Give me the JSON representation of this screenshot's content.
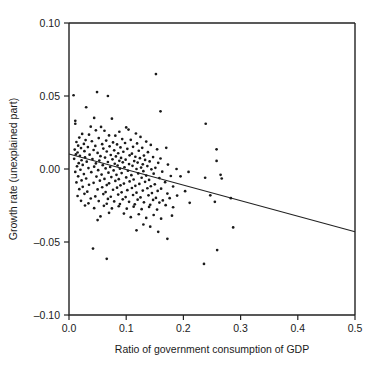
{
  "chart_data": {
    "type": "scatter",
    "title": "",
    "xlabel": "Ratio of government consumption of GDP",
    "ylabel": "Growth rate (unexplained part)",
    "xlim": [
      0.0,
      0.5
    ],
    "ylim": [
      -0.1,
      0.1
    ],
    "xticks": [
      "0.0",
      "0.1",
      "0.2",
      "0.3",
      "0.4",
      "0.5"
    ],
    "xtick_values": [
      0.0,
      0.1,
      0.2,
      0.3,
      0.4,
      0.5
    ],
    "yticks": [
      "0.10",
      "0.05",
      "0.00",
      "–0.05",
      "–0.10"
    ],
    "ytick_values": [
      0.1,
      0.05,
      0.0,
      -0.05,
      -0.1
    ],
    "grid": false,
    "legend": null,
    "marker": "dot",
    "marker_color": "#1a1a1a",
    "n_points": 262,
    "fit_line": {
      "type": "linear-regression",
      "intercept": 0.0103,
      "slope": -0.1066,
      "x_start": 0.0,
      "x_end": 0.5,
      "y_start": 0.0103,
      "y_end": -0.043,
      "color": "#222222"
    },
    "points": [
      [
        0.008,
        0.0505
      ],
      [
        0.049,
        0.0527
      ],
      [
        0.068,
        0.05
      ],
      [
        0.152,
        0.065
      ],
      [
        0.03,
        0.0423
      ],
      [
        0.16,
        0.0395
      ],
      [
        0.044,
        0.035
      ],
      [
        0.075,
        0.0345
      ],
      [
        0.239,
        0.031
      ],
      [
        0.011,
        0.033
      ],
      [
        0.011,
        0.031
      ],
      [
        0.038,
        0.029
      ],
      [
        0.056,
        0.0288
      ],
      [
        0.1,
        0.0285
      ],
      [
        0.104,
        0.027
      ],
      [
        0.047,
        0.0265
      ],
      [
        0.062,
        0.0262
      ],
      [
        0.088,
        0.0255
      ],
      [
        0.117,
        0.0243
      ],
      [
        0.023,
        0.024
      ],
      [
        0.035,
        0.0235
      ],
      [
        0.07,
        0.023
      ],
      [
        0.081,
        0.0228
      ],
      [
        0.125,
        0.022
      ],
      [
        0.018,
        0.0215
      ],
      [
        0.052,
        0.0212
      ],
      [
        0.093,
        0.0205
      ],
      [
        0.108,
        0.02
      ],
      [
        0.029,
        0.0198
      ],
      [
        0.065,
        0.0195
      ],
      [
        0.04,
        0.019
      ],
      [
        0.135,
        0.0188
      ],
      [
        0.013,
        0.0185
      ],
      [
        0.077,
        0.0182
      ],
      [
        0.098,
        0.0178
      ],
      [
        0.119,
        0.0175
      ],
      [
        0.026,
        0.0172
      ],
      [
        0.058,
        0.017
      ],
      [
        0.084,
        0.0168
      ],
      [
        0.143,
        0.0165
      ],
      [
        0.016,
        0.016
      ],
      [
        0.046,
        0.0158
      ],
      [
        0.071,
        0.0155
      ],
      [
        0.112,
        0.0152
      ],
      [
        0.033,
        0.015
      ],
      [
        0.09,
        0.0148
      ],
      [
        0.128,
        0.0145
      ],
      [
        0.021,
        0.0143
      ],
      [
        0.06,
        0.014
      ],
      [
        0.102,
        0.0138
      ],
      [
        0.154,
        0.0135
      ],
      [
        0.01,
        0.0133
      ],
      [
        0.043,
        0.013
      ],
      [
        0.079,
        0.0128
      ],
      [
        0.122,
        0.0125
      ],
      [
        0.027,
        0.0122
      ],
      [
        0.066,
        0.012
      ],
      [
        0.095,
        0.0118
      ],
      [
        0.138,
        0.0115
      ],
      [
        0.015,
        0.0113
      ],
      [
        0.05,
        0.011
      ],
      [
        0.086,
        0.0108
      ],
      [
        0.11,
        0.0105
      ],
      [
        0.17,
        0.0145
      ],
      [
        0.012,
        0.01
      ],
      [
        0.036,
        0.0098
      ],
      [
        0.073,
        0.0096
      ],
      [
        0.106,
        0.0094
      ],
      [
        0.131,
        0.0092
      ],
      [
        0.019,
        0.009
      ],
      [
        0.055,
        0.0088
      ],
      [
        0.082,
        0.0086
      ],
      [
        0.116,
        0.0084
      ],
      [
        0.147,
        0.0082
      ],
      [
        0.028,
        0.008
      ],
      [
        0.063,
        0.0078
      ],
      [
        0.091,
        0.0076
      ],
      [
        0.124,
        0.0074
      ],
      [
        0.16,
        0.0072
      ],
      [
        0.009,
        0.007
      ],
      [
        0.041,
        0.0068
      ],
      [
        0.076,
        0.0066
      ],
      [
        0.099,
        0.0064
      ],
      [
        0.133,
        0.0062
      ],
      [
        0.258,
        0.0135
      ],
      [
        0.022,
        0.006
      ],
      [
        0.053,
        0.0058
      ],
      [
        0.088,
        0.0056
      ],
      [
        0.114,
        0.0054
      ],
      [
        0.141,
        0.0052
      ],
      [
        0.031,
        0.005
      ],
      [
        0.068,
        0.0048
      ],
      [
        0.094,
        0.0046
      ],
      [
        0.12,
        0.0044
      ],
      [
        0.156,
        0.0042
      ],
      [
        0.017,
        0.004
      ],
      [
        0.047,
        0.0038
      ],
      [
        0.08,
        0.0036
      ],
      [
        0.105,
        0.0034
      ],
      [
        0.129,
        0.0032
      ],
      [
        0.173,
        0.003
      ],
      [
        0.024,
        0.0028
      ],
      [
        0.059,
        0.0026
      ],
      [
        0.085,
        0.0024
      ],
      [
        0.111,
        0.0022
      ],
      [
        0.137,
        0.002
      ],
      [
        0.258,
        0.0055
      ],
      [
        0.014,
        0.0018
      ],
      [
        0.044,
        0.0016
      ],
      [
        0.072,
        0.0014
      ],
      [
        0.097,
        0.0012
      ],
      [
        0.126,
        0.001
      ],
      [
        0.151,
        0.0008
      ],
      [
        0.034,
        0.0006
      ],
      [
        0.064,
        0.0004
      ],
      [
        0.089,
        0.0002
      ],
      [
        0.118,
        0.0
      ],
      [
        0.144,
        -0.0002
      ],
      [
        0.188,
        0.0
      ],
      [
        0.02,
        -0.0005
      ],
      [
        0.051,
        -0.0008
      ],
      [
        0.078,
        -0.001
      ],
      [
        0.103,
        -0.0012
      ],
      [
        0.13,
        -0.0015
      ],
      [
        0.163,
        -0.0018
      ],
      [
        0.011,
        -0.002
      ],
      [
        0.039,
        -0.0022
      ],
      [
        0.069,
        -0.0025
      ],
      [
        0.092,
        -0.0028
      ],
      [
        0.121,
        -0.003
      ],
      [
        0.148,
        -0.0032
      ],
      [
        0.209,
        -0.002
      ],
      [
        0.026,
        -0.0035
      ],
      [
        0.057,
        -0.0038
      ],
      [
        0.083,
        -0.004
      ],
      [
        0.109,
        -0.0042
      ],
      [
        0.135,
        -0.0045
      ],
      [
        0.178,
        -0.0048
      ],
      [
        0.016,
        -0.005
      ],
      [
        0.048,
        -0.0052
      ],
      [
        0.074,
        -0.0055
      ],
      [
        0.1,
        -0.0058
      ],
      [
        0.127,
        -0.006
      ],
      [
        0.158,
        -0.0062
      ],
      [
        0.265,
        -0.004
      ],
      [
        0.03,
        -0.0065
      ],
      [
        0.062,
        -0.0068
      ],
      [
        0.087,
        -0.007
      ],
      [
        0.113,
        -0.0072
      ],
      [
        0.14,
        -0.0075
      ],
      [
        0.195,
        -0.005
      ],
      [
        0.022,
        -0.0078
      ],
      [
        0.054,
        -0.008
      ],
      [
        0.081,
        -0.0082
      ],
      [
        0.106,
        -0.0085
      ],
      [
        0.133,
        -0.0088
      ],
      [
        0.168,
        -0.009
      ],
      [
        0.013,
        -0.0092
      ],
      [
        0.043,
        -0.0095
      ],
      [
        0.07,
        -0.0098
      ],
      [
        0.096,
        -0.01
      ],
      [
        0.123,
        -0.0102
      ],
      [
        0.15,
        -0.0105
      ],
      [
        0.238,
        -0.006
      ],
      [
        0.035,
        -0.0108
      ],
      [
        0.066,
        -0.011
      ],
      [
        0.09,
        -0.0112
      ],
      [
        0.116,
        -0.0115
      ],
      [
        0.143,
        -0.0118
      ],
      [
        0.182,
        -0.012
      ],
      [
        0.024,
        -0.0122
      ],
      [
        0.058,
        -0.0125
      ],
      [
        0.084,
        -0.0128
      ],
      [
        0.11,
        -0.013
      ],
      [
        0.137,
        -0.0132
      ],
      [
        0.161,
        -0.0135
      ],
      [
        0.267,
        -0.0065
      ],
      [
        0.018,
        -0.0138
      ],
      [
        0.05,
        -0.014
      ],
      [
        0.077,
        -0.0142
      ],
      [
        0.102,
        -0.0145
      ],
      [
        0.129,
        -0.0148
      ],
      [
        0.155,
        -0.015
      ],
      [
        0.203,
        -0.0152
      ],
      [
        0.032,
        -0.0155
      ],
      [
        0.064,
        -0.0158
      ],
      [
        0.092,
        -0.016
      ],
      [
        0.118,
        -0.0162
      ],
      [
        0.145,
        -0.0165
      ],
      [
        0.172,
        -0.0168
      ],
      [
        0.027,
        -0.017
      ],
      [
        0.06,
        -0.0172
      ],
      [
        0.086,
        -0.0175
      ],
      [
        0.112,
        -0.0178
      ],
      [
        0.139,
        -0.018
      ],
      [
        0.189,
        -0.0182
      ],
      [
        0.247,
        -0.018
      ],
      [
        0.015,
        -0.0185
      ],
      [
        0.046,
        -0.0188
      ],
      [
        0.073,
        -0.019
      ],
      [
        0.099,
        -0.0192
      ],
      [
        0.125,
        -0.0195
      ],
      [
        0.152,
        -0.0198
      ],
      [
        0.176,
        -0.02
      ],
      [
        0.038,
        -0.0202
      ],
      [
        0.068,
        -0.0205
      ],
      [
        0.094,
        -0.0208
      ],
      [
        0.12,
        -0.021
      ],
      [
        0.147,
        -0.0212
      ],
      [
        0.164,
        -0.0215
      ],
      [
        0.283,
        -0.02
      ],
      [
        0.021,
        -0.0218
      ],
      [
        0.052,
        -0.022
      ],
      [
        0.079,
        -0.0222
      ],
      [
        0.105,
        -0.0225
      ],
      [
        0.131,
        -0.0228
      ],
      [
        0.158,
        -0.023
      ],
      [
        0.211,
        -0.0232
      ],
      [
        0.034,
        -0.0235
      ],
      [
        0.066,
        -0.0238
      ],
      [
        0.089,
        -0.024
      ],
      [
        0.115,
        -0.0242
      ],
      [
        0.142,
        -0.0245
      ],
      [
        0.169,
        -0.0248
      ],
      [
        0.028,
        -0.025
      ],
      [
        0.061,
        -0.0252
      ],
      [
        0.087,
        -0.0255
      ],
      [
        0.113,
        -0.0258
      ],
      [
        0.14,
        -0.026
      ],
      [
        0.182,
        -0.0262
      ],
      [
        0.255,
        -0.0225
      ],
      [
        0.044,
        -0.0268
      ],
      [
        0.075,
        -0.027
      ],
      [
        0.101,
        -0.0272
      ],
      [
        0.127,
        -0.0275
      ],
      [
        0.154,
        -0.0278
      ],
      [
        0.07,
        -0.03
      ],
      [
        0.096,
        -0.0305
      ],
      [
        0.122,
        -0.031
      ],
      [
        0.148,
        -0.0315
      ],
      [
        0.18,
        -0.032
      ],
      [
        0.055,
        -0.0325
      ],
      [
        0.108,
        -0.033
      ],
      [
        0.135,
        -0.0335
      ],
      [
        0.161,
        -0.034
      ],
      [
        0.05,
        -0.035
      ],
      [
        0.13,
        -0.038
      ],
      [
        0.142,
        -0.0395
      ],
      [
        0.287,
        -0.04
      ],
      [
        0.118,
        -0.042
      ],
      [
        0.156,
        -0.043
      ],
      [
        0.172,
        -0.0478
      ],
      [
        0.042,
        -0.0545
      ],
      [
        0.259,
        -0.0555
      ],
      [
        0.066,
        -0.0615
      ],
      [
        0.236,
        -0.065
      ]
    ]
  }
}
